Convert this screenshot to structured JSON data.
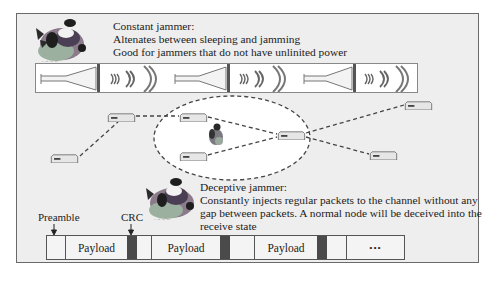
{
  "constant_jammer": {
    "title": "Constant jammer:",
    "line1": "Altenates between sleeping and jamming",
    "line2": "Good for jammers that do not have unlinited power"
  },
  "deceptive_jammer": {
    "title": "Deceptive jammer:",
    "line1": "Constantly injects regular packets to the channel without any",
    "line2": "gap between packets. A normal node will be deceived into the",
    "line3": "receive state"
  },
  "signal_strip": {
    "segments": [
      "horn-icon",
      "radio-waves-icon",
      "horn-icon",
      "radio-waves-icon",
      "horn-icon",
      "radio-waves-icon"
    ]
  },
  "network": {
    "node_icon": "network-node-icon",
    "jammer_icon": "jammer-figure-icon",
    "node_count": 7
  },
  "packet": {
    "preamble_label": "Preamble",
    "crc_label": "CRC",
    "payload_1": "Payload",
    "payload_2": "Payload",
    "payload_3": "Payload",
    "ellipsis": "•••"
  },
  "colors": {
    "frame_bg": "#eeeeee",
    "frame_border": "#6a6a6a",
    "crc_fill": "#4a4a4a",
    "node_fill": "#e8e8e8",
    "dash_line": "#444444"
  }
}
